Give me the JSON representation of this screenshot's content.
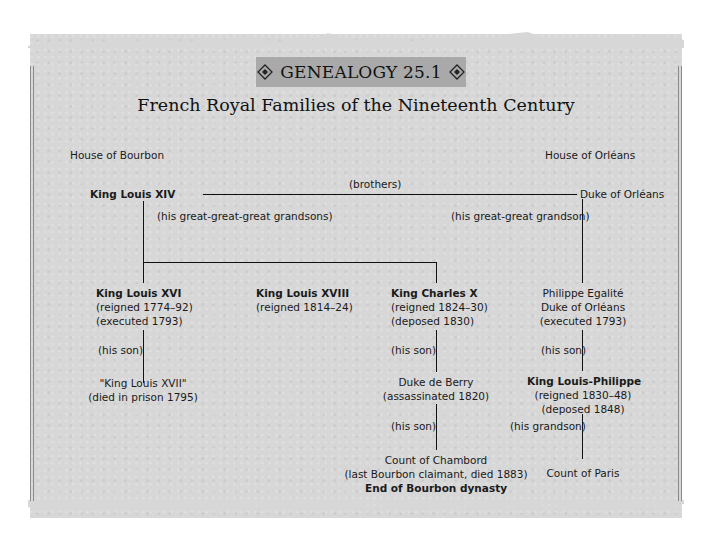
{
  "banner": {
    "label": "GENEALOGY 25.1",
    "ornament_icon": "diamond-ornament-icon"
  },
  "title": "French Royal Families of the Nineteenth Century",
  "houses": {
    "left": "House of Bourbon",
    "right": "House of Orléans"
  },
  "relations": {
    "brothers": "(brothers)",
    "great_great_great_grandsons": "(his great-great-great grandsons)",
    "great_great_grandson": "(his great-great grandson)",
    "son_louis16": "(his son)",
    "son_charles10": "(his son)",
    "son_berry": "(his son)",
    "son_egalite": "(his son)",
    "grandson_lp": "(his grandson)"
  },
  "people": {
    "louis14": {
      "name": "King Louis XIV"
    },
    "duke_orleans": {
      "name": "Duke of Orléans"
    },
    "louis16": {
      "name": "King Louis XVI",
      "line1": "(reigned 1774–92)",
      "line2": "(executed 1793)"
    },
    "louis18": {
      "name": "King Louis XVIII",
      "line1": "(reigned 1814–24)"
    },
    "charles10": {
      "name": "King Charles X",
      "line1": "(reigned 1824–30)",
      "line2": "(deposed 1830)"
    },
    "egalite": {
      "name": "Philippe Egalité",
      "line1": "Duke of Orléans",
      "line2": "(executed 1793)"
    },
    "louis17": {
      "name": "\"King Louis XVII\"",
      "line1": "(died in prison 1795)"
    },
    "berry": {
      "name": "Duke de Berry",
      "line1": "(assassinated 1820)"
    },
    "louis_philippe": {
      "name": "King Louis-Philippe",
      "line1": "(reigned 1830–48)",
      "line2": "(deposed 1848)"
    },
    "chambord": {
      "name": "Count of Chambord",
      "line1": "(last Bourbon claimant, died 1883)",
      "line2": "End of Bourbon dynasty"
    },
    "paris": {
      "name": "Count of Paris"
    }
  },
  "colors": {
    "panel": "#d7d7d7",
    "banner": "#a9a9a9",
    "ink": "#111111"
  }
}
